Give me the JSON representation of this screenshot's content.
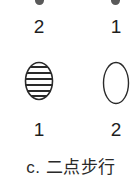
{
  "diagram": {
    "top_row": {
      "left_label": "2",
      "right_label": "1"
    },
    "bottom_row": {
      "left_label": "1",
      "right_label": "2",
      "left_shape": "striped-ellipse",
      "right_shape": "empty-ellipse"
    },
    "caption": "c. 二点步行",
    "colors": {
      "dot": "#5a5a5a",
      "stroke": "#2a2a2a",
      "text": "#1e1e1e"
    }
  }
}
